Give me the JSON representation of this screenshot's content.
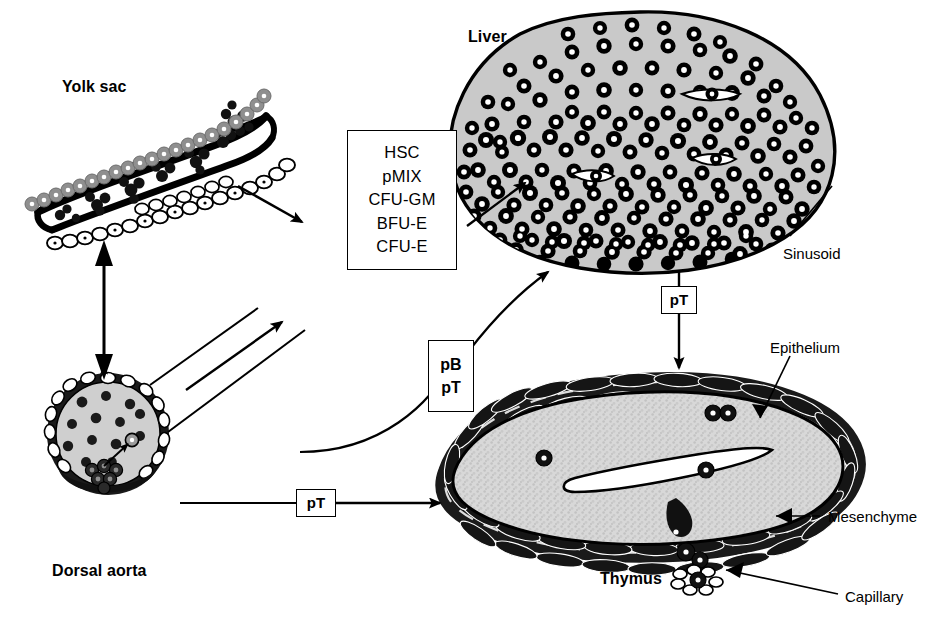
{
  "figure": {
    "type": "biological-schematic",
    "title_visible": false,
    "background_color": "#ffffff",
    "ink_color": "#000000",
    "gray_fill": "#b3b3b3",
    "light_gray_fill": "#d9d9d9"
  },
  "organ_labels": [
    {
      "id": "yolk-sac",
      "text": "Yolk sac",
      "x": 62,
      "y": 78
    },
    {
      "id": "liver",
      "text": "Liver",
      "x": 468,
      "y": 28
    },
    {
      "id": "dorsal-aorta",
      "text": "Dorsal aorta",
      "x": 52,
      "y": 562
    },
    {
      "id": "thymus",
      "text": "Thymus",
      "x": 600,
      "y": 570
    }
  ],
  "part_labels": [
    {
      "id": "sinusoid",
      "text": "Sinusoid",
      "x": 783,
      "y": 245
    },
    {
      "id": "epithelium",
      "text": "Epithelium",
      "x": 770,
      "y": 339
    },
    {
      "id": "mesenchyme",
      "text": "Mesenchyme",
      "x": 828,
      "y": 508
    },
    {
      "id": "capillary",
      "text": "Capillary",
      "x": 845,
      "y": 588
    }
  ],
  "cell_type_box": {
    "id": "progenitor-list",
    "x": 347,
    "y": 130,
    "width": 110,
    "height": 140,
    "items": [
      "HSC",
      "pMIX",
      "CFU-GM",
      "BFU-E",
      "CFU-E"
    ]
  },
  "marker_boxes": [
    {
      "id": "pb-pt-box",
      "lines": [
        "pB",
        "pT"
      ],
      "x": 428,
      "y": 340,
      "width": 46,
      "height": 72
    },
    {
      "id": "pt-box-liver-thymus",
      "lines": [
        "pT"
      ],
      "x": 661,
      "y": 286,
      "width": 36,
      "height": 28
    },
    {
      "id": "pt-box-aorta-thymus",
      "lines": [
        "pT"
      ],
      "x": 296,
      "y": 489,
      "width": 40,
      "height": 28
    }
  ],
  "arrows": [
    {
      "id": "yolksac-to-box",
      "from": "Yolk sac",
      "to": "progenitor list box",
      "style": "single-head"
    },
    {
      "id": "box-to-liver",
      "from": "progenitor list box",
      "to": "Liver",
      "style": "single-head"
    },
    {
      "id": "yolksac-aorta-bidirectional",
      "from": "Yolk sac",
      "to": "Dorsal aorta",
      "style": "double-head"
    },
    {
      "id": "aorta-to-box",
      "from": "Dorsal aorta",
      "to": "progenitor list box",
      "style": "single-head"
    },
    {
      "id": "aorta-to-liver-curved",
      "from": "Dorsal aorta",
      "to": "Liver",
      "style": "curved-single-head",
      "marker": "pB pT"
    },
    {
      "id": "liver-to-thymus",
      "from": "Liver",
      "to": "Thymus",
      "style": "single-head",
      "marker": "pT"
    },
    {
      "id": "aorta-to-thymus",
      "from": "Dorsal aorta",
      "to": "Thymus",
      "style": "single-head",
      "marker": "pT"
    }
  ],
  "leader_lines": [
    {
      "id": "sinusoid-leader",
      "target": "Liver sinusoid"
    },
    {
      "id": "epithelium-leader",
      "target": "Thymus epithelium"
    },
    {
      "id": "mesenchyme-leader",
      "target": "Thymus mesenchyme"
    },
    {
      "id": "capillary-leader",
      "target": "Thymus capillary"
    }
  ],
  "caption": {
    "partial_text": "",
    "note_visible": false
  }
}
